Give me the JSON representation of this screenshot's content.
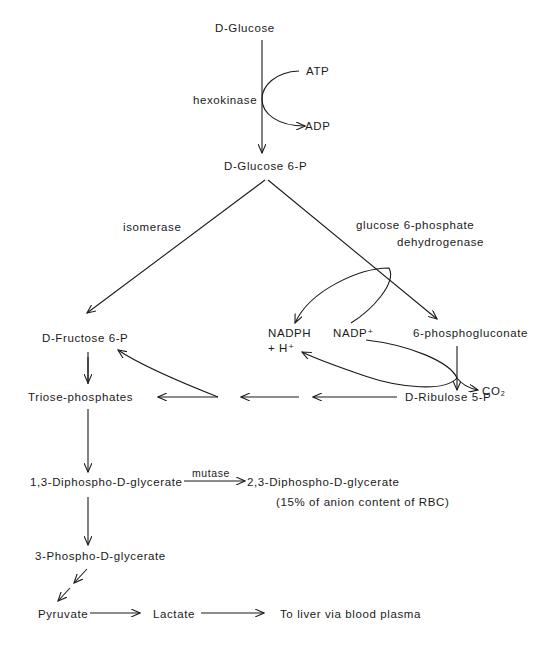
{
  "diagram": {
    "type": "metabolic-pathway",
    "nodes": {
      "glucose": "D-Glucose",
      "atp": "ATP",
      "adp": "ADP",
      "glucose6p": "D-Glucose 6-P",
      "fructose6p": "D-Fructose 6-P",
      "nadph": "NADPH",
      "h_plus": "+ H⁺",
      "nadp_plus": "NADP⁺",
      "phosphogluconate": "6-phosphogluconate",
      "co2": "CO₂",
      "ribulose5p": "D-Ribulose 5-P",
      "triose": "Triose-phosphates",
      "dpg13": "1,3-Diphospho-D-glycerate",
      "dpg23": "2,3-Diphospho-D-glycerate",
      "dpg23_note": "(15% of anion content of RBC)",
      "pg3": "3-Phospho-D-glycerate",
      "pyruvate": "Pyruvate",
      "lactate": "Lactate",
      "liver": "To liver via blood plasma"
    },
    "enzymes": {
      "hexokinase": "hexokinase",
      "isomerase": "isomerase",
      "g6pd_line1": "glucose 6-phosphate",
      "g6pd_line2": "dehydrogenase",
      "mutase": "mutase"
    },
    "edges": [
      {
        "from": "D-Glucose",
        "to": "D-Glucose 6-P",
        "enzyme": "hexokinase",
        "cofactor": "ATP → ADP"
      },
      {
        "from": "D-Glucose 6-P",
        "to": "D-Fructose 6-P",
        "enzyme": "isomerase"
      },
      {
        "from": "D-Glucose 6-P",
        "to": "6-phosphogluconate",
        "enzyme": "glucose 6-phosphate dehydrogenase",
        "cofactor": "NADP⁺ → NADPH + H⁺"
      },
      {
        "from": "6-phosphogluconate",
        "to": "D-Ribulose 5-P",
        "cofactor": "NADP⁺ → NADPH + H⁺, releases CO₂"
      },
      {
        "from": "D-Ribulose 5-P",
        "to": "Triose-phosphates"
      },
      {
        "from": "D-Ribulose 5-P",
        "to": "D-Fructose 6-P"
      },
      {
        "from": "D-Fructose 6-P",
        "to": "Triose-phosphates",
        "steps": 2
      },
      {
        "from": "Triose-phosphates",
        "to": "1,3-Diphospho-D-glycerate"
      },
      {
        "from": "1,3-Diphospho-D-glycerate",
        "to": "2,3-Diphospho-D-glycerate",
        "enzyme": "mutase"
      },
      {
        "from": "1,3-Diphospho-D-glycerate",
        "to": "3-Phospho-D-glycerate"
      },
      {
        "from": "3-Phospho-D-glycerate",
        "to": "Pyruvate",
        "steps": 2
      },
      {
        "from": "Pyruvate",
        "to": "Lactate"
      },
      {
        "from": "Lactate",
        "to": "To liver via blood plasma"
      }
    ]
  }
}
